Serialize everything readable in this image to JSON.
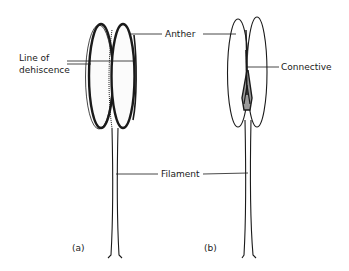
{
  "diagram": {
    "type": "botanical-illustration",
    "labels": {
      "anther": "Anther",
      "line_of_dehiscence_1": "Line of",
      "line_of_dehiscence_2": "dehiscence",
      "connective": "Connective",
      "filament": "Filament"
    },
    "panels": [
      {
        "id": "a",
        "caption": "(a)"
      },
      {
        "id": "b",
        "caption": "(b)"
      }
    ],
    "colors": {
      "ink": "#1a1a1a",
      "background": "#ffffff"
    }
  }
}
